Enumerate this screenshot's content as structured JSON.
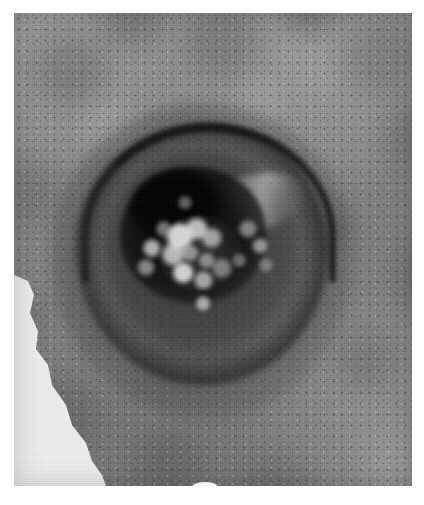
{
  "image": {
    "kind": "clinical-photograph",
    "media": "halftone-printed photograph (scanned)",
    "color_mode": "grayscale",
    "width_px": 424,
    "height_px": 505,
    "page_background": "#ffffff",
    "plate": {
      "left_px": 14,
      "top_px": 13,
      "width_px": 398,
      "height_px": 473,
      "base_tone": "#8d8d8d"
    }
  },
  "subject": {
    "description": "Ulcerated cutaneous nodule with a raised rolled dark border and a necrotic crusted centre, on mottled skin",
    "regions": [
      {
        "name": "background-skin",
        "label": "Surrounding skin",
        "tone": "#8f8f8f",
        "texture": "mottled, fine speckled pores"
      },
      {
        "name": "lesion-halo",
        "label": "Diffuse erythematous halo",
        "tone": "#3b3b3b"
      },
      {
        "name": "lesion-rim",
        "label": "Raised rolled border",
        "tone": "#1a1a1a"
      },
      {
        "name": "lesion-floor",
        "label": "Sunken ulcer floor",
        "tone": "#4a4a4a"
      },
      {
        "name": "lesion-sheen",
        "label": "Glistening shoulder (upper right)",
        "tone": "#dcdcdc"
      },
      {
        "name": "crater",
        "label": "Central ulcer crater",
        "tone": "#060606"
      },
      {
        "name": "crust",
        "label": "Necrotic crusted plug",
        "tone": "#e6e6e6"
      },
      {
        "name": "white-wedge",
        "label": "White backdrop wedge (lower left)",
        "tone": "#f2f2f0"
      }
    ]
  },
  "geometry": {
    "lesion": {
      "center_x_px": 188,
      "center_y_px": 254,
      "outer_diameter_px": 252
    },
    "crater": {
      "center_x_px": 193,
      "center_y_px": 245,
      "diameter_px": 146
    },
    "white_wedge_path": "M 0,262 L 14,268 L 20,282 L 16,300 L 24,318 L 22,336 L 34,352 L 38,372 L 52,392 L 58,412 L 72,430 L 78,448 L 88,462 L 92,473 L 0,473 Z"
  },
  "annotations": {
    "has_text": false,
    "has_scale_bar": false,
    "has_arrows": false
  }
}
